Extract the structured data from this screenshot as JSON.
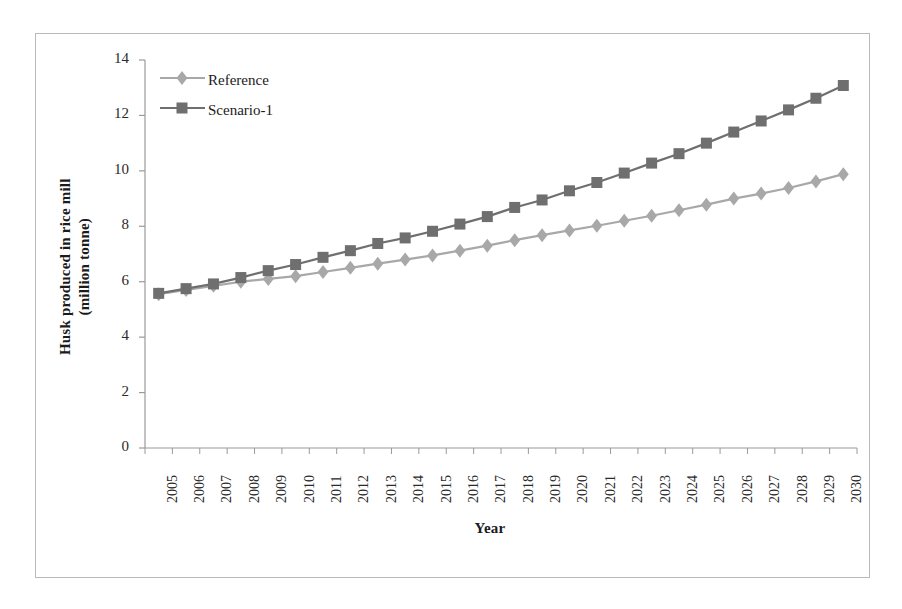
{
  "chart_data": {
    "type": "line",
    "title": "",
    "xlabel": "Year",
    "ylabel": "Husk produced in rice mill (million tonne)",
    "ylabel_line1": "Husk produced in rice mill",
    "ylabel_line2": "(million tonne)",
    "ylim": [
      0,
      14
    ],
    "yticks": [
      0,
      2,
      4,
      6,
      8,
      10,
      12,
      14
    ],
    "ytick_labels": [
      "0",
      "2",
      "4",
      "6",
      "8",
      "10",
      "12",
      "14"
    ],
    "grid": false,
    "legend_position": "top-left inside plot",
    "categories": [
      "2005",
      "2006",
      "2007",
      "2008",
      "2009",
      "2010",
      "2011",
      "2012",
      "2013",
      "2014",
      "2015",
      "2016",
      "2017",
      "2018",
      "2019",
      "2020",
      "2021",
      "2022",
      "2023",
      "2024",
      "2025",
      "2026",
      "2027",
      "2028",
      "2029",
      "2030"
    ],
    "series": [
      {
        "name": "Reference",
        "color": "#a8a8a8",
        "marker": "diamond",
        "values": [
          5.55,
          5.7,
          5.85,
          6.0,
          6.1,
          6.2,
          6.35,
          6.5,
          6.65,
          6.8,
          6.95,
          7.12,
          7.3,
          7.5,
          7.68,
          7.85,
          8.02,
          8.2,
          8.38,
          8.58,
          8.78,
          9.0,
          9.18,
          9.38,
          9.62,
          9.88
        ]
      },
      {
        "name": "Scenario-1",
        "color": "#6f6f6f",
        "marker": "square",
        "values": [
          5.58,
          5.75,
          5.92,
          6.15,
          6.4,
          6.62,
          6.88,
          7.12,
          7.38,
          7.58,
          7.82,
          8.08,
          8.35,
          8.68,
          8.95,
          9.28,
          9.58,
          9.92,
          10.28,
          10.62,
          11.0,
          11.4,
          11.8,
          12.2,
          12.62,
          13.08
        ]
      }
    ]
  },
  "legend": {
    "items": [
      {
        "label": "Reference"
      },
      {
        "label": "Scenario-1"
      }
    ]
  }
}
